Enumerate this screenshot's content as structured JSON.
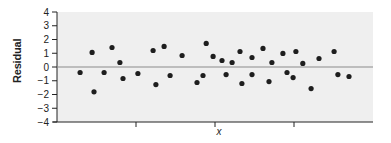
{
  "chart_data": {
    "type": "scatter",
    "title": "",
    "xlabel": "x",
    "ylabel": "Residual",
    "ylim": [
      -4,
      4
    ],
    "yticks": [
      4,
      3,
      2,
      1,
      0,
      -1,
      -2,
      -3,
      -4
    ],
    "ytick_labels": [
      "4",
      "3",
      "2",
      "1",
      "0",
      "−1",
      "−2",
      "−3",
      "−4"
    ],
    "xlim": [
      0,
      1
    ],
    "xticks": [
      0.25,
      0.5,
      0.75
    ],
    "xtick_labels": [
      "",
      "",
      ""
    ],
    "grid": false,
    "legend": null,
    "reference_line": {
      "y": 0,
      "color": "#8c8c8c"
    },
    "background_color": "#efefef",
    "point_color": "#1e1e1e",
    "series": [
      {
        "name": "residuals",
        "x": [
          0.073,
          0.111,
          0.117,
          0.149,
          0.174,
          0.199,
          0.209,
          0.256,
          0.304,
          0.313,
          0.339,
          0.358,
          0.396,
          0.443,
          0.462,
          0.472,
          0.494,
          0.522,
          0.535,
          0.554,
          0.579,
          0.585,
          0.617,
          0.617,
          0.652,
          0.671,
          0.68,
          0.715,
          0.728,
          0.747,
          0.756,
          0.778,
          0.804,
          0.829,
          0.877,
          0.889,
          0.924
        ],
        "y": [
          -0.4,
          1.06,
          -1.8,
          -0.4,
          1.42,
          0.33,
          -0.84,
          -0.47,
          1.2,
          -1.28,
          1.5,
          -0.62,
          0.84,
          -1.13,
          -0.62,
          1.72,
          0.77,
          0.47,
          -0.55,
          0.33,
          1.13,
          -1.2,
          0.69,
          -0.55,
          1.35,
          -1.06,
          0.33,
          0.99,
          -0.4,
          -0.77,
          1.13,
          0.26,
          -1.57,
          0.62,
          1.13,
          -0.55,
          -0.69
        ]
      }
    ]
  }
}
